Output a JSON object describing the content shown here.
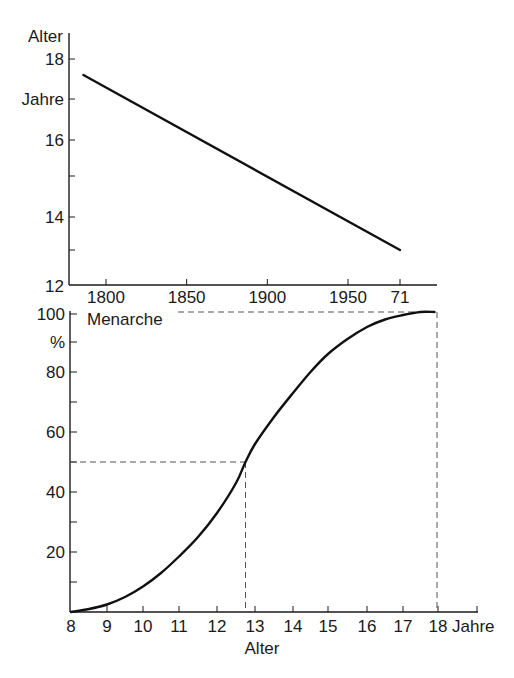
{
  "chart_data": [
    {
      "type": "line",
      "title": "",
      "ylabel": "Alter",
      "ylabel_unit": "Jahre",
      "xlabel": "",
      "ylim": [
        12,
        18.4
      ],
      "xlim": [
        1780,
        1990
      ],
      "yticks": [
        12,
        13,
        14,
        15,
        16,
        17,
        18
      ],
      "ytick_labels": {
        "12": "12",
        "14": "14",
        "16": "16",
        "17": "Jahre",
        "18": "18"
      },
      "xticks": [
        1800,
        1850,
        1900,
        1950,
        1971
      ],
      "xtick_labels": [
        "1800",
        "1850",
        "1900",
        "1950",
        "71"
      ],
      "series": [
        {
          "name": "Durchschnittliches Menarchealter",
          "x": [
            1786,
            1971
          ],
          "y": [
            17.6,
            13.0
          ]
        }
      ],
      "grid": false
    },
    {
      "type": "line",
      "title": "",
      "ylabel": "%",
      "xlabel": "Alter",
      "xlabel_unit": "Jahre",
      "annotation": "Menarche",
      "ylim": [
        0,
        100
      ],
      "xlim": [
        8,
        19
      ],
      "yticks": [
        0,
        10,
        20,
        30,
        40,
        50,
        60,
        70,
        80,
        90,
        100
      ],
      "ytick_labels": {
        "20": "20",
        "40": "40",
        "60": "60",
        "80": "80",
        "90": "%",
        "100": "100"
      },
      "xticks": [
        8,
        9,
        10,
        11,
        12,
        13,
        14,
        15,
        16,
        17,
        18
      ],
      "xtick_labels": [
        "8",
        "9",
        "10",
        "11",
        "12",
        "13",
        "14",
        "15",
        "16",
        "17",
        "18"
      ],
      "series": [
        {
          "name": "Menarche kumulativ (%)",
          "x": [
            8.0,
            8.5,
            9.0,
            9.5,
            10.0,
            10.5,
            11.0,
            11.5,
            12.0,
            12.5,
            12.75,
            13.0,
            13.5,
            14.0,
            14.5,
            15.0,
            15.5,
            16.0,
            16.5,
            17.0,
            17.5,
            17.9
          ],
          "y": [
            0,
            1,
            2.5,
            5,
            8.5,
            13,
            18.5,
            25,
            33,
            43,
            50,
            56,
            65,
            73,
            80,
            86,
            91,
            95,
            97.5,
            99,
            100,
            100
          ]
        }
      ],
      "reference_lines": [
        {
          "type": "horizontal",
          "y": 50,
          "x_to": 12.75
        },
        {
          "type": "vertical",
          "x": 12.75,
          "y_to": 50
        },
        {
          "type": "horizontal",
          "y": 100,
          "x_to": 18
        },
        {
          "type": "vertical",
          "x": 18,
          "y_to": 100
        }
      ],
      "grid": false
    }
  ],
  "labels": {
    "top_ylabel": "Alter",
    "top_yunit": "Jahre",
    "bottom_ylabel": "%",
    "bottom_xlabel": "Alter",
    "bottom_xunit": "Jahre",
    "annotation": "Menarche"
  }
}
